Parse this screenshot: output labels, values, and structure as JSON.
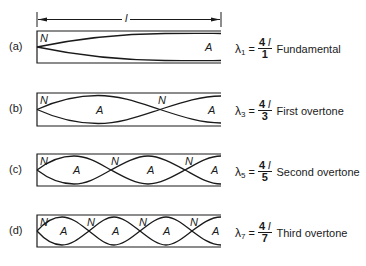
{
  "dimension": {
    "label": "l"
  },
  "rows": [
    {
      "tag": "(a)",
      "nodes": [
        {
          "t": "N",
          "x": 40,
          "y": 32
        },
        {
          "t": "A",
          "x": 205,
          "y": 41
        }
      ],
      "formula": {
        "lambda": "λ",
        "sub": "1",
        "eq": "=",
        "num": "4",
        "num_var": "l",
        "den": "1",
        "name": "Fundamental"
      }
    },
    {
      "tag": "(b)",
      "nodes": [
        {
          "t": "N",
          "x": 40,
          "y": 94
        },
        {
          "t": "A",
          "x": 96,
          "y": 104
        },
        {
          "t": "N",
          "x": 158,
          "y": 94
        },
        {
          "t": "A",
          "x": 208,
          "y": 104
        }
      ],
      "formula": {
        "lambda": "λ",
        "sub": "3",
        "eq": "=",
        "num": "4",
        "num_var": "l",
        "den": "3",
        "name": "First overtone"
      }
    },
    {
      "tag": "(c)",
      "nodes": [
        {
          "t": "N",
          "x": 40,
          "y": 155
        },
        {
          "t": "A",
          "x": 73,
          "y": 164
        },
        {
          "t": "N",
          "x": 111,
          "y": 155
        },
        {
          "t": "A",
          "x": 147,
          "y": 164
        },
        {
          "t": "N",
          "x": 185,
          "y": 155
        },
        {
          "t": "A",
          "x": 211,
          "y": 164
        }
      ],
      "formula": {
        "lambda": "λ",
        "sub": "5",
        "eq": "=",
        "num": "4",
        "num_var": "l",
        "den": "5",
        "name": "Second overtone"
      }
    },
    {
      "tag": "(d)",
      "nodes": [
        {
          "t": "N",
          "x": 40,
          "y": 216
        },
        {
          "t": "A",
          "x": 60,
          "y": 225
        },
        {
          "t": "N",
          "x": 87,
          "y": 216
        },
        {
          "t": "A",
          "x": 112,
          "y": 225
        },
        {
          "t": "N",
          "x": 139,
          "y": 216
        },
        {
          "t": "A",
          "x": 163,
          "y": 225
        },
        {
          "t": "N",
          "x": 190,
          "y": 216
        },
        {
          "t": "A",
          "x": 212,
          "y": 225
        }
      ],
      "formula": {
        "lambda": "λ",
        "sub": "7",
        "eq": "=",
        "num": "4",
        "num_var": "l",
        "den": "7",
        "name": "Third overtone"
      }
    }
  ]
}
